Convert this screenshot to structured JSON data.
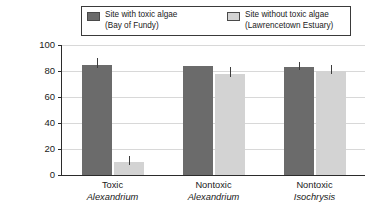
{
  "chart_data": {
    "type": "bar",
    "title": "",
    "xlabel": "",
    "ylabel": "Percentage of burrowed clams",
    "ylim": [
      0,
      100
    ],
    "yticks": [
      0,
      20,
      40,
      60,
      80,
      100
    ],
    "ytick_labels": [
      "0",
      "20",
      "40",
      "60",
      "80",
      "100"
    ],
    "grid": "horizontal",
    "legend_position": "top-center",
    "categories": [
      {
        "line1": "Toxic",
        "line2": "Alexandrium"
      },
      {
        "line1": "Nontoxic",
        "line2": "Alexandrium"
      },
      {
        "line1": "Nontoxic",
        "line2": "Isochrysis"
      }
    ],
    "series": [
      {
        "name": "Site with toxic algae",
        "sublabel": "(Bay of Fundy)",
        "color": "#6b6b6b",
        "values": [
          85,
          84,
          83
        ],
        "errors": [
          5,
          0,
          4
        ]
      },
      {
        "name": "Site without toxic algae",
        "sublabel": "(Lawrencetown Estuary)",
        "color": "#d3d3d3",
        "values": [
          10,
          78,
          80
        ],
        "errors": [
          5,
          5,
          5
        ]
      }
    ]
  },
  "legend": {
    "entries": [
      {
        "label": "Site with toxic algae",
        "sublabel": "(Bay of Fundy)",
        "swatch": "#6b6b6b"
      },
      {
        "label": "Site without toxic algae",
        "sublabel": "(Lawrencetown Estuary)",
        "swatch": "#d3d3d3"
      }
    ]
  }
}
